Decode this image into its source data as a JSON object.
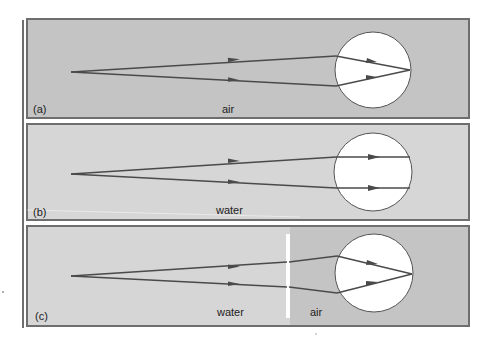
{
  "figure": {
    "colors": {
      "background": "#ffffff",
      "panel_air": "#c4c4c4",
      "panel_water": "#d6d6d6",
      "panel_border": "#6e6e6e",
      "ray": "#4a4a4a",
      "eye": "#ffffff",
      "eye_stroke": "#555555",
      "interface_line": "#ffffff"
    },
    "panels": [
      {
        "id": "a",
        "tag": "(a)",
        "medium_label": "air",
        "description": "Rays from object in air converge to a focus on the retina",
        "focus": "on-retina"
      },
      {
        "id": "b",
        "tag": "(b)",
        "medium_label": "water",
        "description": "Rays in water pass through the eye nearly unrefracted, focus behind retina",
        "focus": "none"
      },
      {
        "id": "c",
        "tag": "(c)",
        "medium_label_left": "water",
        "medium_label_right": "air",
        "description": "Air layer (goggles) in front of eye restores focus on retina",
        "focus": "on-retina"
      }
    ]
  }
}
